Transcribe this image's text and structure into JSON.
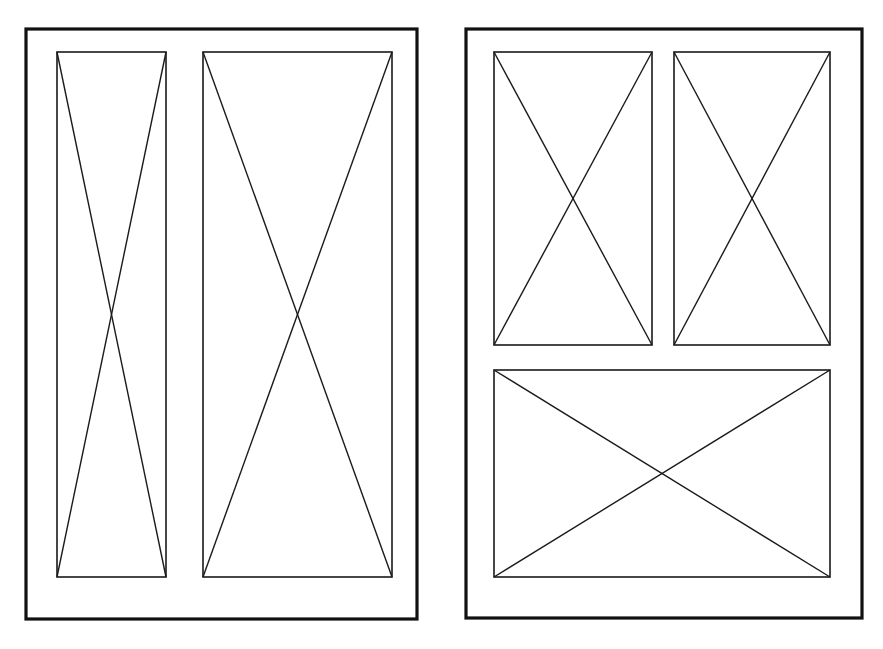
{
  "document": {
    "title": "Page Layout Wireframe",
    "description": "Two page-layout frames with crossed placeholder blocks",
    "canvas_width": 883,
    "canvas_height": 649,
    "background_color": "#ffffff",
    "line_color": "#1a1a1a",
    "frame_color": "#111111"
  },
  "panels": [
    {
      "id": "panel-left",
      "name": "left-page-frame",
      "label": "Left page frame",
      "x": 26,
      "y": 29,
      "width": 391,
      "height": 590,
      "stroke_width": 3.2,
      "slots": [
        {
          "id": "slot-left-narrow",
          "name": "placeholder-block-left-narrow",
          "label": "Narrow placeholder block",
          "x": 57,
          "y": 52,
          "width": 109,
          "height": 525,
          "diagonals": "both"
        },
        {
          "id": "slot-left-wide",
          "name": "placeholder-block-left-wide",
          "label": "Wide placeholder block",
          "x": 203,
          "y": 52,
          "width": 189,
          "height": 525,
          "diagonals": "both"
        }
      ]
    },
    {
      "id": "panel-right",
      "name": "right-page-frame",
      "label": "Right page frame",
      "x": 466,
      "y": 29,
      "width": 396,
      "height": 589,
      "stroke_width": 3.2,
      "slots": [
        {
          "id": "slot-right-top-left",
          "name": "placeholder-block-top-left",
          "label": "Top left placeholder block",
          "x": 494,
          "y": 52,
          "width": 158,
          "height": 293,
          "diagonals": "both"
        },
        {
          "id": "slot-right-top-right",
          "name": "placeholder-block-top-right",
          "label": "Top right placeholder block",
          "x": 674,
          "y": 52,
          "width": 156,
          "height": 293,
          "diagonals": "both"
        },
        {
          "id": "slot-right-bottom",
          "name": "placeholder-block-bottom-wide",
          "label": "Bottom wide placeholder block",
          "x": 494,
          "y": 370,
          "width": 336,
          "height": 207,
          "diagonals": "both"
        }
      ]
    }
  ]
}
